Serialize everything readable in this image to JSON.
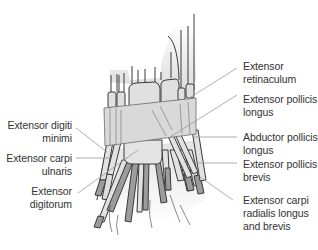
{
  "figure": {
    "colors": {
      "background": "#ffffff",
      "retinaculum": "#dadada",
      "tendon_fill": "#e2e2e2",
      "tendon_dark": "#9c9c9c",
      "outline": "#3a3a3a",
      "leader_line": "#9a9a9a",
      "label_text": "#333333"
    }
  },
  "labels_left": [
    {
      "id": "extensor-digiti-minimi",
      "lines": [
        "Extensor digiti",
        "minimi"
      ]
    },
    {
      "id": "extensor-carpi-ulnaris",
      "lines": [
        "Extensor carpi",
        "ulnaris"
      ]
    },
    {
      "id": "extensor-digitorum",
      "lines": [
        "Extensor",
        "digitorum"
      ]
    }
  ],
  "labels_right": [
    {
      "id": "extensor-retinaculum",
      "lines": [
        "Extensor",
        "retinaculum"
      ]
    },
    {
      "id": "extensor-pollicis-longus",
      "lines": [
        "Extensor pollicis",
        "longus"
      ]
    },
    {
      "id": "abductor-pollicis-longus",
      "lines": [
        "Abductor pollicis",
        "longus"
      ]
    },
    {
      "id": "extensor-pollicis-brevis",
      "lines": [
        "Extensor pollicis",
        "brevis"
      ]
    },
    {
      "id": "extensor-carpi-radialis",
      "lines": [
        "Extensor carpi",
        "radialis longus",
        "and brevis"
      ]
    }
  ]
}
